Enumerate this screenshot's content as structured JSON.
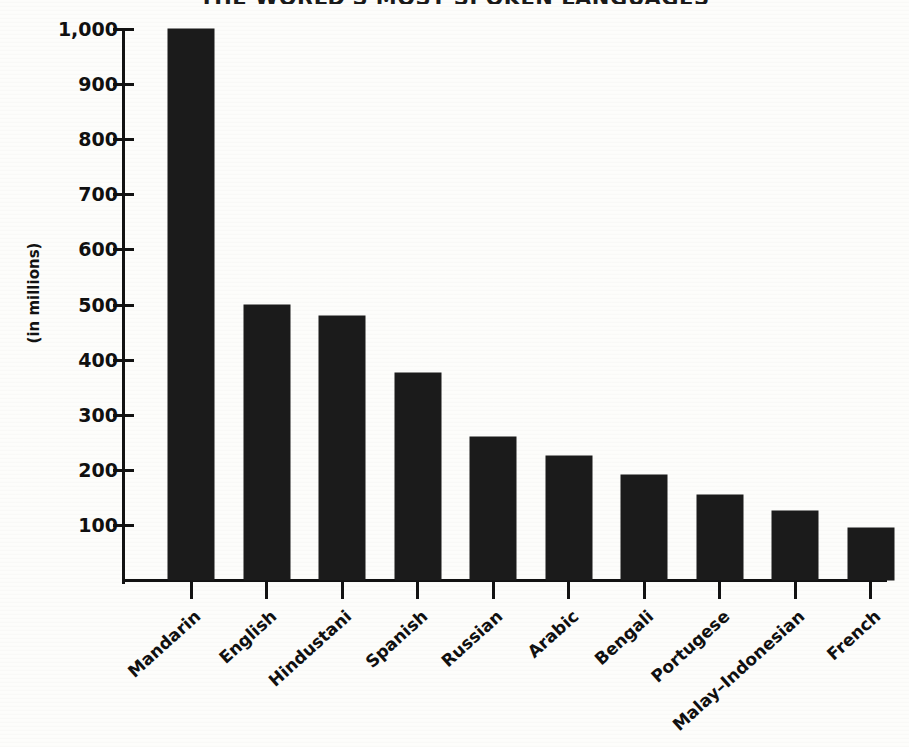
{
  "chart_data": {
    "type": "bar",
    "title": "THE WORLD'S MOST SPOKEN LANGUAGES",
    "subtitle": "",
    "xlabel": "",
    "ylabel": "(in millions)",
    "categories": [
      "Mandarin",
      "English",
      "Hindustani",
      "Spanish",
      "Russian",
      "Arabic",
      "Bengali",
      "Portugese",
      "Malay–Indonesian",
      "French"
    ],
    "values": [
      1000,
      500,
      480,
      375,
      260,
      225,
      190,
      155,
      125,
      95
    ],
    "ylim": [
      0,
      1000
    ],
    "yticks": [
      100,
      200,
      300,
      400,
      500,
      600,
      700,
      800,
      900,
      1000
    ],
    "ytick_labels": [
      "100",
      "200",
      "300",
      "400",
      "500",
      "600",
      "700",
      "800",
      "900",
      "1,000"
    ],
    "grid": false,
    "legend": false,
    "bar_color": "#1b1b1b",
    "background_color": "#fdfdfb",
    "axis_color": "#121212"
  },
  "axis": {
    "y_label": "(in millions)"
  },
  "title": {
    "text": "THE WORLD'S MOST SPOKEN LANGUAGES"
  }
}
